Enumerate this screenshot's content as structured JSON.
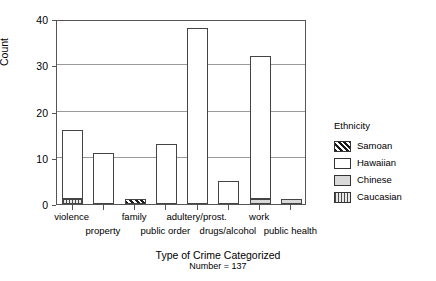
{
  "chart_data": {
    "type": "bar",
    "title": "",
    "xlabel": "Type of Crime Categorized",
    "xlabel_sub": "Number = 137",
    "ylabel": "Count",
    "ylim": [
      0,
      40
    ],
    "yticks": [
      0,
      10,
      20,
      30,
      40
    ],
    "grid": true,
    "stacked": true,
    "legend_title": "Ethnicity",
    "legend_position": "right",
    "categories": [
      "violence",
      "property",
      "family",
      "public order",
      "adultery/prost.",
      "drugs/alcohol",
      "work",
      "public health"
    ],
    "series": [
      {
        "name": "Samoan",
        "values": [
          0,
          0,
          1,
          0,
          0,
          0,
          0,
          0
        ]
      },
      {
        "name": "Hawaiian",
        "values": [
          15,
          11,
          0,
          13,
          38,
          5,
          31,
          0
        ]
      },
      {
        "name": "Chinese",
        "values": [
          0,
          0,
          0,
          0,
          0,
          0,
          1,
          1
        ]
      },
      {
        "name": "Caucasian",
        "values": [
          1,
          0,
          0,
          0,
          0,
          0,
          0,
          0
        ]
      }
    ],
    "totals": [
      16,
      11,
      1,
      13,
      38,
      5,
      32,
      1
    ]
  },
  "legend": {
    "title": "Ethnicity",
    "entries": [
      {
        "label": "Samoan",
        "pattern": "diagonal-hatch"
      },
      {
        "label": "Hawaiian",
        "pattern": "solid-white"
      },
      {
        "label": "Chinese",
        "pattern": "light-gray"
      },
      {
        "label": "Caucasian",
        "pattern": "vertical-stripes"
      }
    ]
  },
  "axes": {
    "y_title": "Count",
    "y_ticks": [
      "0",
      "10",
      "20",
      "30",
      "40"
    ],
    "x_title": "Type of Crime Categorized",
    "x_subtitle": "Number = 137",
    "x_ticks": [
      "violence",
      "property",
      "family",
      "public order",
      "adultery/prost.",
      "drugs/alcohol",
      "work",
      "public health"
    ]
  }
}
